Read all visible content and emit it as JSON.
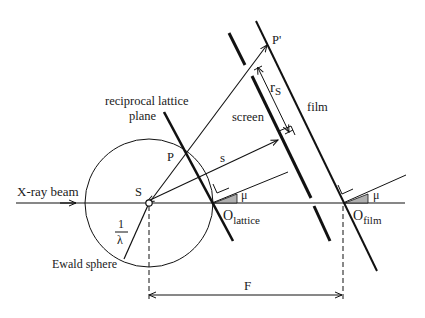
{
  "diagram": {
    "labels": {
      "xray_beam": "X-ray beam",
      "ewald_sphere": "Ewald sphere",
      "reciprocal_lattice_plane_line1": "reciprocal lattice",
      "reciprocal_lattice_plane_line2": "plane",
      "screen": "screen",
      "film": "film",
      "point_S": "S",
      "point_P": "P",
      "point_P_prime": "P'",
      "vector_s": "s",
      "radius_numerator": "1",
      "radius_denominator": "λ",
      "r_s_main": "r",
      "r_s_sub": "S",
      "O_lattice_main": "O",
      "O_lattice_sub": "lattice",
      "O_film_main": "O",
      "O_film_sub": "film",
      "mu_1": "μ",
      "mu_2": "μ",
      "distance_F": "F"
    },
    "colors": {
      "line": "#111111",
      "angle_fill": "#b0b0b0",
      "background": "#ffffff"
    }
  }
}
